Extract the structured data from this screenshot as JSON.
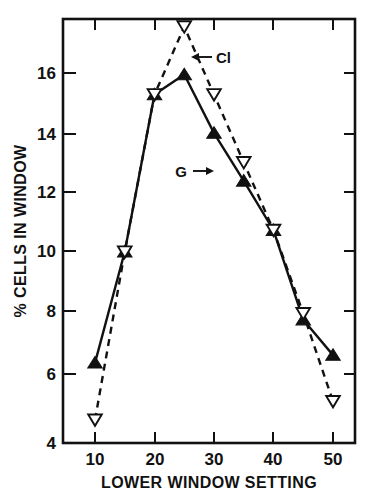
{
  "chart_data": {
    "type": "line",
    "title": "",
    "xlabel": "LOWER WINDOW SETTING",
    "ylabel": "% CELLS IN WINDOW",
    "xlim": [
      5,
      55
    ],
    "ylim": [
      4,
      18
    ],
    "xticks": [
      10,
      20,
      30,
      40,
      50
    ],
    "xtick_labels": [
      "10",
      "20",
      "30",
      "40",
      "50"
    ],
    "yticks": [
      4,
      6,
      8,
      10,
      12,
      14,
      16
    ],
    "ytick_labels": [
      "4",
      "6",
      "8",
      "10",
      "12",
      "14",
      "16"
    ],
    "grid": false,
    "legend": "inline-annotations",
    "x": [
      10,
      15,
      20,
      25,
      30,
      35,
      40,
      45,
      50
    ],
    "series": [
      {
        "name": "G",
        "marker": "filled-up-triangle",
        "linestyle": "solid",
        "values": [
          6.6,
          10.2,
          15.3,
          15.95,
          14.05,
          12.5,
          10.9,
          8.0,
          6.85
        ]
      },
      {
        "name": "Cl",
        "marker": "open-down-triangle",
        "linestyle": "dashed",
        "values": [
          4.75,
          10.2,
          15.3,
          17.5,
          15.3,
          13.1,
          10.9,
          8.2,
          5.35
        ]
      }
    ],
    "annotations": [
      {
        "label": "Cl",
        "target_series": "Cl",
        "arrow": "left"
      },
      {
        "label": "G",
        "target_series": "G",
        "arrow": "right"
      }
    ],
    "colors": {
      "axis": "#111111",
      "series_g": "#111111",
      "series_cl": "#111111",
      "background": "#ffffff"
    }
  }
}
